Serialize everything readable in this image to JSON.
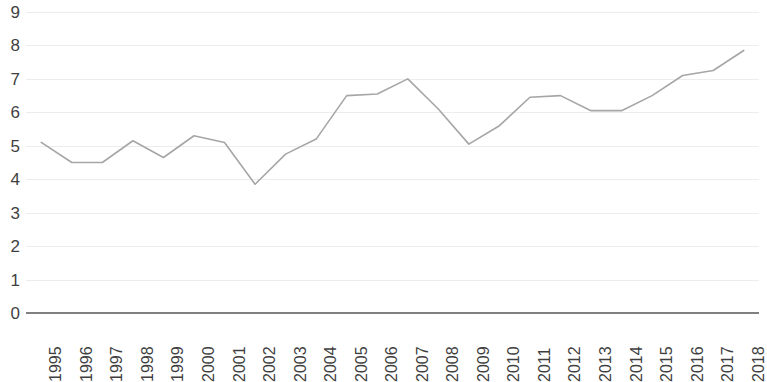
{
  "chart_data": {
    "type": "line",
    "title": "",
    "subtitle": "",
    "xlabel": "",
    "ylabel": "",
    "categories": [
      "1995",
      "1996",
      "1997",
      "1998",
      "1999",
      "2000",
      "2001",
      "2002",
      "2003",
      "2004",
      "2005",
      "2006",
      "2007",
      "2008",
      "2009",
      "2010",
      "2011",
      "2012",
      "2013",
      "2014",
      "2015",
      "2016",
      "2017",
      "2018"
    ],
    "values": [
      5.1,
      4.5,
      4.5,
      5.15,
      4.65,
      5.3,
      5.1,
      3.85,
      4.75,
      5.2,
      6.5,
      6.55,
      7.0,
      6.1,
      5.05,
      5.6,
      6.45,
      6.5,
      6.05,
      6.05,
      6.5,
      7.1,
      7.25,
      7.85
    ],
    "series": [
      {
        "name": "",
        "values": [
          5.1,
          4.5,
          4.5,
          5.15,
          4.65,
          5.3,
          5.1,
          3.85,
          4.75,
          5.2,
          6.5,
          6.55,
          7.0,
          6.1,
          5.05,
          5.6,
          6.45,
          6.5,
          6.05,
          6.05,
          6.5,
          7.1,
          7.25,
          7.85
        ],
        "color": "#a6a6a6"
      }
    ],
    "ylim": [
      0,
      9
    ],
    "yticks": [
      0,
      1,
      2,
      3,
      4,
      5,
      6,
      7,
      8,
      9
    ],
    "ytick_labels": [
      "0",
      "1",
      "2",
      "3",
      "4",
      "5",
      "6",
      "7",
      "8",
      "9"
    ],
    "grid": true,
    "grid_color": "#ededed",
    "legend": false,
    "legend_position": "none",
    "markers": false,
    "line_width": 1.6,
    "axis_color": "#808080",
    "tick_label_color": "#3f3f3f",
    "background": "#ffffff",
    "xtick_rotation": -90
  },
  "layout": {
    "plot_left": 26,
    "plot_right": 759,
    "y_top_px": 12,
    "y_bottom_px": 313
  }
}
